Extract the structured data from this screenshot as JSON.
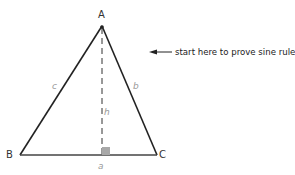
{
  "diagram": {
    "vertices": {
      "A": {
        "label": "A",
        "x": 102,
        "y": 26
      },
      "B": {
        "label": "B",
        "x": 20,
        "y": 155
      },
      "C": {
        "label": "C",
        "x": 157,
        "y": 155
      }
    },
    "sides": {
      "a": "a",
      "b": "b",
      "c": "c"
    },
    "altitude_label": "h",
    "annotation": "start here to prove sine rule",
    "colors": {
      "lines": "#222222",
      "side_labels": "#9a9a9a",
      "right_angle_marker": "#a8a8a8"
    }
  }
}
